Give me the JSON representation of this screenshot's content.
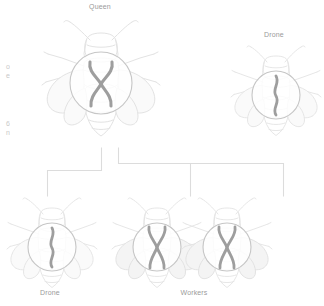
{
  "diagram": {
    "title_context": "honeybee-chromosome-inheritance",
    "colors": {
      "bee_outline": "#e3e3e3",
      "bee_outline_dark": "#d2d2d2",
      "wing_fill": "#f6f6f6",
      "circle_stroke": "#c6c6c6",
      "chromosome": "#9e9e9e",
      "connector": "#dcdcdc",
      "label_text": "#9a9a9a",
      "margin_text": "#c9c9c9"
    },
    "labels": {
      "queen": "Queen",
      "drone_parent": "Drone",
      "drone_offspring": "Drone",
      "workers": "Workers"
    },
    "margin_notes": {
      "upper": [
        "o",
        "e"
      ],
      "lower": [
        "6",
        "n"
      ]
    },
    "organisms": [
      {
        "id": "queen",
        "label": "Queen",
        "role": "parent",
        "ploidy": "diploid",
        "chromosome_glyph": "x-pair",
        "chromosome_count": 2,
        "size": "large",
        "position": {
          "x": 100,
          "y": 28
        }
      },
      {
        "id": "drone-parent",
        "label": "Drone",
        "role": "parent",
        "ploidy": "haploid",
        "chromosome_glyph": "single-wavy",
        "chromosome_count": 1,
        "size": "medium",
        "position": {
          "x": 274,
          "y": 48
        }
      },
      {
        "id": "drone-offspring",
        "label": "Drone",
        "role": "offspring",
        "ploidy": "haploid",
        "chromosome_glyph": "single-wavy",
        "chromosome_count": 1,
        "size": "medium",
        "position": {
          "x": 50,
          "y": 238
        }
      },
      {
        "id": "worker-1",
        "label": "Workers",
        "role": "offspring",
        "ploidy": "diploid",
        "chromosome_glyph": "x-pair",
        "chromosome_count": 2,
        "size": "medium",
        "position": {
          "x": 155,
          "y": 238
        }
      },
      {
        "id": "worker-2",
        "label": "Workers",
        "role": "offspring",
        "ploidy": "diploid",
        "chromosome_glyph": "x-pair",
        "chromosome_count": 2,
        "size": "medium",
        "position": {
          "x": 225,
          "y": 238
        }
      }
    ],
    "connectors": [
      {
        "id": "queen-to-drone",
        "from": "queen",
        "to": "drone-offspring"
      },
      {
        "id": "queen-to-workers",
        "from": "queen",
        "to": "worker-1"
      },
      {
        "id": "queen-to-workers-2",
        "from": "queen",
        "to": "worker-2"
      }
    ]
  }
}
